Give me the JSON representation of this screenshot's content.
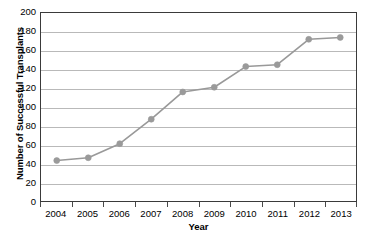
{
  "chart_data": {
    "type": "line",
    "title": "",
    "xlabel": "Year",
    "ylabel": "Number of Successful Transplants",
    "categories": [
      "2004",
      "2005",
      "2006",
      "2007",
      "2008",
      "2009",
      "2010",
      "2011",
      "2012",
      "2013"
    ],
    "values": [
      43,
      46,
      61,
      87,
      116,
      121,
      143,
      145,
      172,
      174
    ],
    "series": [
      {
        "name": "Successful Transplants",
        "values": [
          43,
          46,
          61,
          87,
          116,
          121,
          143,
          145,
          172,
          174
        ]
      }
    ],
    "ylim": [
      0,
      200
    ],
    "ytick_step": 20,
    "yticks": [
      200,
      180,
      160,
      140,
      120,
      100,
      80,
      60,
      40,
      20,
      0
    ],
    "grid": "horizontal",
    "legend": "none",
    "line_color": "#999999",
    "marker_color": "#9a9a9a",
    "marker_shape": "circle",
    "grid_color": "#b9b9b9",
    "frame_color": "#3a3a3a",
    "text_color": "#000000",
    "background": "#ffffff"
  }
}
